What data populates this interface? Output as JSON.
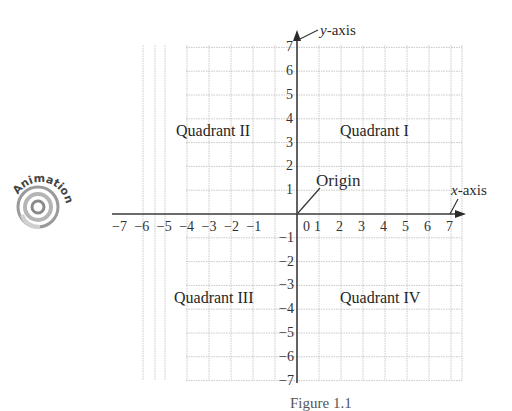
{
  "figure": {
    "caption_partial": "Figure 1.1"
  },
  "badge": {
    "label": "Animation",
    "icon": "animation-swirl-icon"
  },
  "axes": {
    "x_label_var": "x",
    "x_label_suffix": "-axis",
    "y_label_var": "y",
    "y_label_suffix": "-axis",
    "origin_label": "Origin"
  },
  "quadrants": {
    "q1": "Quadrant I",
    "q2": "Quadrant II",
    "q3": "Quadrant III",
    "q4": "Quadrant IV"
  },
  "colors": {
    "axis": "#3a3a3a",
    "grid": "#c8c8c8",
    "text": "#2a2a2a"
  },
  "chart_data": {
    "type": "scatter",
    "title": "",
    "xlabel": "x-axis",
    "ylabel": "y-axis",
    "xlim": [
      -7,
      7
    ],
    "ylim": [
      -7,
      7
    ],
    "grid": true,
    "x_ticks": [
      "−7",
      "−6",
      "−5",
      "−4",
      "−3",
      "−2",
      "−1",
      "0",
      "1",
      "2",
      "3",
      "4",
      "5",
      "6",
      "7"
    ],
    "y_ticks": [
      "7",
      "6",
      "5",
      "4",
      "3",
      "2",
      "1",
      "−1",
      "−2",
      "−3",
      "−4",
      "−5",
      "−6",
      "−7"
    ],
    "annotations": [
      {
        "text": "Origin",
        "x": 0,
        "y": 0
      },
      {
        "text": "Quadrant I",
        "x": 3.5,
        "y": 3.5
      },
      {
        "text": "Quadrant II",
        "x": -3.5,
        "y": 3.5
      },
      {
        "text": "Quadrant III",
        "x": -3.5,
        "y": -3.5
      },
      {
        "text": "Quadrant IV",
        "x": 3.5,
        "y": -3.5
      }
    ],
    "series": []
  }
}
